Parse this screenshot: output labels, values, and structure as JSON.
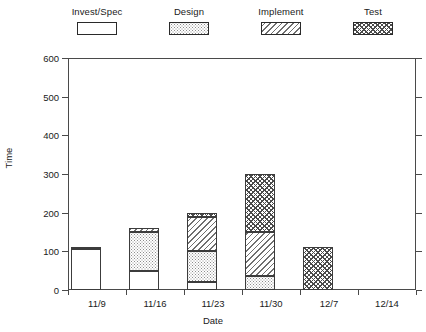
{
  "chart_data": {
    "type": "bar",
    "subtype": "stacked",
    "title": "",
    "xlabel": "Date",
    "ylabel": "Time",
    "categories": [
      "11/9",
      "11/16",
      "11/23",
      "11/30",
      "12/7",
      "12/14"
    ],
    "ylim": [
      0,
      600
    ],
    "yticks": [
      0,
      100,
      200,
      300,
      400,
      500,
      600
    ],
    "grid": false,
    "legend_position": "top",
    "series": [
      {
        "name": "Invest/Spec",
        "pattern": "solid-white",
        "values": [
          105,
          50,
          20,
          0,
          0,
          0
        ]
      },
      {
        "name": "Design",
        "pattern": "dotted",
        "values": [
          7,
          100,
          80,
          35,
          0,
          0
        ]
      },
      {
        "name": "Implement",
        "pattern": "diagonal-hatch",
        "values": [
          0,
          10,
          90,
          115,
          0,
          0
        ]
      },
      {
        "name": "Test",
        "pattern": "checkerboard",
        "values": [
          0,
          0,
          10,
          150,
          112,
          0
        ]
      }
    ],
    "totals": [
      112,
      160,
      200,
      300,
      112,
      0
    ]
  },
  "legend": {
    "entries": [
      {
        "label": "Invest/Spec",
        "swatch": "fill-invest"
      },
      {
        "label": "Design",
        "swatch": "fill-design"
      },
      {
        "label": "Implement",
        "swatch": "fill-implement"
      },
      {
        "label": "Test",
        "swatch": "fill-test"
      }
    ]
  },
  "colors": {
    "axis": "#4a4a4a",
    "text": "#1a1a1a",
    "background": "#ffffff",
    "bar_outline": "#3c3c3c"
  }
}
